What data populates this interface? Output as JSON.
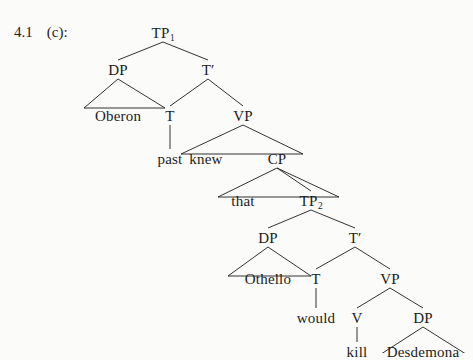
{
  "figure": {
    "example_number": "4.1",
    "example_letter": "(c):",
    "sentence": "Oberon knew that Othello would kill Desdemona",
    "ink_color": "#1c1c1c",
    "background_color": "#fbfbf9"
  },
  "tree": {
    "nodes": [
      {
        "id": "tp1",
        "label": "TP",
        "subscript": "1",
        "x": 163,
        "y": 26,
        "kind": "phrase"
      },
      {
        "id": "dp1",
        "label": "DP",
        "x": 118,
        "y": 63,
        "kind": "phrase"
      },
      {
        "id": "oberon",
        "label": "Oberon",
        "x": 118,
        "y": 109,
        "kind": "terminal"
      },
      {
        "id": "tbar1",
        "label": "T",
        "prime": "′",
        "x": 208,
        "y": 63,
        "kind": "bar"
      },
      {
        "id": "t1",
        "label": "T",
        "x": 170,
        "y": 109,
        "kind": "head"
      },
      {
        "id": "past",
        "label": "past",
        "x": 170,
        "y": 152,
        "kind": "terminal"
      },
      {
        "id": "vp1",
        "label": "VP",
        "x": 243,
        "y": 109,
        "kind": "phrase"
      },
      {
        "id": "knew",
        "label": "knew",
        "x": 206,
        "y": 152,
        "kind": "terminal"
      },
      {
        "id": "cp",
        "label": "CP",
        "x": 277,
        "y": 152,
        "kind": "phrase"
      },
      {
        "id": "that",
        "label": "that",
        "x": 243,
        "y": 194,
        "kind": "terminal"
      },
      {
        "id": "tp2",
        "label": "TP",
        "subscript": "2",
        "x": 311,
        "y": 194,
        "kind": "phrase"
      },
      {
        "id": "dp2",
        "label": "DP",
        "x": 268,
        "y": 231,
        "kind": "phrase"
      },
      {
        "id": "othello",
        "label": "Othello",
        "x": 268,
        "y": 272,
        "kind": "terminal"
      },
      {
        "id": "tbar2",
        "label": "T",
        "prime": "′",
        "x": 355,
        "y": 231,
        "kind": "bar"
      },
      {
        "id": "t2",
        "label": "T",
        "x": 316,
        "y": 272,
        "kind": "head"
      },
      {
        "id": "would",
        "label": "would",
        "x": 316,
        "y": 311,
        "kind": "terminal"
      },
      {
        "id": "vp2",
        "label": "VP",
        "x": 390,
        "y": 272,
        "kind": "phrase"
      },
      {
        "id": "v",
        "label": "V",
        "x": 357,
        "y": 311,
        "kind": "head"
      },
      {
        "id": "kill",
        "label": "kill",
        "x": 357,
        "y": 345,
        "kind": "terminal"
      },
      {
        "id": "dp3",
        "label": "DP",
        "x": 423,
        "y": 311,
        "kind": "phrase"
      },
      {
        "id": "desdemona",
        "label": "Desdemona",
        "x": 423,
        "y": 345,
        "kind": "terminal"
      }
    ],
    "branches": [
      {
        "from": "tp1",
        "to": "dp1"
      },
      {
        "from": "tp1",
        "to": "tbar1"
      },
      {
        "from": "tbar1",
        "to": "t1"
      },
      {
        "from": "tbar1",
        "to": "vp1"
      },
      {
        "from": "t1",
        "to": "past"
      },
      {
        "from": "cp",
        "to": "tp2"
      },
      {
        "from": "tp2",
        "to": "dp2"
      },
      {
        "from": "tp2",
        "to": "tbar2"
      },
      {
        "from": "tbar2",
        "to": "t2"
      },
      {
        "from": "tbar2",
        "to": "vp2"
      },
      {
        "from": "t2",
        "to": "would"
      },
      {
        "from": "vp2",
        "to": "v"
      },
      {
        "from": "vp2",
        "to": "dp3"
      },
      {
        "from": "v",
        "to": "kill"
      }
    ],
    "triangles": [
      {
        "apex": "dp1",
        "covers": "oberon",
        "left": 84,
        "right": 165
      },
      {
        "apex": "vp1",
        "covers": "knew-cp",
        "left": 181,
        "right": 303
      },
      {
        "apex": "cp",
        "covers": "that-tp2",
        "left": 218,
        "right": 339
      },
      {
        "apex": "dp2",
        "covers": "othello",
        "left": 228,
        "right": 311
      },
      {
        "apex": "dp3",
        "covers": "desdemona",
        "left": 378,
        "right": 469
      }
    ]
  }
}
